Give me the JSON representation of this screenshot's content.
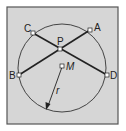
{
  "diagram": {
    "background_color": "#d6d6d6",
    "frame_color": "#555555",
    "line_color": "#222222",
    "circle": {
      "center_label": "M",
      "radius_label": "r"
    },
    "points": {
      "A": {
        "label": "A"
      },
      "B": {
        "label": "B"
      },
      "C": {
        "label": "C"
      },
      "D": {
        "label": "D"
      },
      "P": {
        "label": "P"
      },
      "M": {
        "label": "M"
      }
    },
    "chords": [
      "AB",
      "CD"
    ],
    "intersection": "P"
  }
}
